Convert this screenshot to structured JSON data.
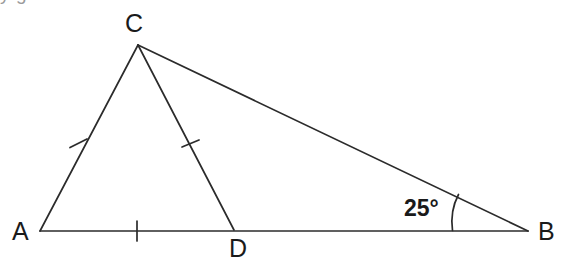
{
  "figure": {
    "type": "geometry-diagram",
    "background_color": "#ffffff",
    "stroke_color": "#2b2b2b",
    "label_color": "#1a1a1a",
    "cropped_text_above": "y                                           g",
    "vertices": [
      {
        "name": "A",
        "label": "A",
        "x": 40,
        "y": 231,
        "label_x": 12,
        "label_y": 240
      },
      {
        "name": "B",
        "label": "B",
        "x": 528,
        "y": 231,
        "label_x": 538,
        "label_y": 240
      },
      {
        "name": "C",
        "label": "C",
        "x": 138,
        "y": 45,
        "label_x": 125,
        "label_y": 32
      },
      {
        "name": "D",
        "label": "D",
        "x": 234,
        "y": 230,
        "label_x": 229,
        "label_y": 256
      }
    ],
    "segments": [
      {
        "name": "segment-AB",
        "from": "A",
        "to": "B",
        "x1": 40,
        "y1": 231,
        "x2": 528,
        "y2": 231
      },
      {
        "name": "segment-AC",
        "from": "A",
        "to": "C",
        "x1": 40,
        "y1": 231,
        "x2": 138,
        "y2": 45
      },
      {
        "name": "segment-CB",
        "from": "C",
        "to": "B",
        "x1": 138,
        "y1": 45,
        "x2": 528,
        "y2": 231
      },
      {
        "name": "segment-CD",
        "from": "C",
        "to": "D",
        "x1": 138,
        "y1": 45,
        "x2": 234,
        "y2": 230
      }
    ],
    "tick_marks": [
      {
        "name": "tick-on-AC",
        "on_segment": "segment-AC",
        "count": 1,
        "x": 78,
        "y": 143,
        "x1": 70,
        "y1": 147,
        "x2": 87,
        "y2": 139
      },
      {
        "name": "tick-on-CD",
        "on_segment": "segment-CD",
        "count": 1,
        "x": 190,
        "y": 143,
        "x1": 182,
        "y1": 147,
        "x2": 199,
        "y2": 139
      },
      {
        "name": "tick-on-AD",
        "on_segment": "segment-AB",
        "count": 1,
        "x": 137,
        "y": 231,
        "x1": 137,
        "y1": 221,
        "x2": 137,
        "y2": 241
      }
    ],
    "angles": [
      {
        "name": "angle-at-B",
        "at_vertex": "B",
        "value": "25°",
        "label": "25°",
        "label_x": 404,
        "label_y": 216,
        "arc_path": "M 452.5 230.5 Q 449.5 210 458.5 194.5"
      }
    ]
  }
}
